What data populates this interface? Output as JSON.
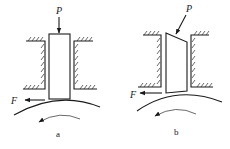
{
  "figure": {
    "panels": [
      {
        "id": "a",
        "caption": "a",
        "force_label": "P",
        "friction_label": "F",
        "description": "Vertical block pressed by a vertical force P against a rotating cylinder"
      },
      {
        "id": "b",
        "caption": "b",
        "force_label": "P",
        "friction_label": "F",
        "description": "Block with slanted top pressed by an inclined force P against a rotating cylinder"
      }
    ],
    "colors": {
      "line": "#1a1a1a",
      "background": "#ffffff"
    }
  }
}
